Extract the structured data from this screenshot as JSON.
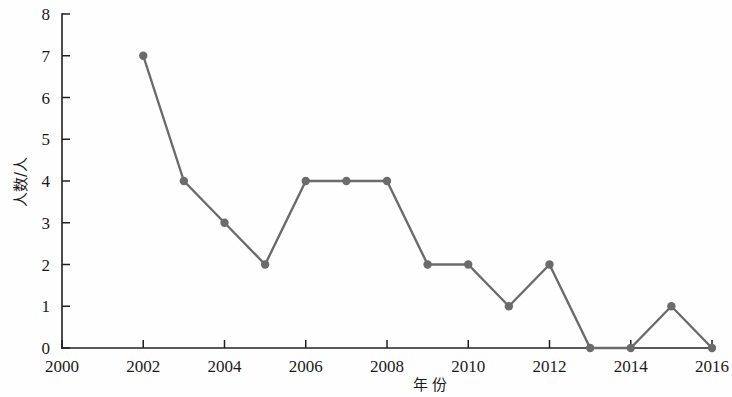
{
  "chart_data": {
    "type": "line",
    "title": "",
    "xlabel": "年 份",
    "ylabel": "人数/人",
    "x": [
      2002,
      2003,
      2004,
      2005,
      2006,
      2007,
      2008,
      2009,
      2010,
      2011,
      2012,
      2013,
      2014,
      2015,
      2016
    ],
    "values": [
      7,
      4,
      3,
      2,
      4,
      4,
      4,
      2,
      2,
      1,
      2,
      0,
      0,
      1,
      0
    ],
    "series": [
      {
        "name": "人数",
        "values": [
          7,
          4,
          3,
          2,
          4,
          4,
          4,
          2,
          2,
          1,
          2,
          0,
          0,
          1,
          0
        ]
      }
    ],
    "xlim": [
      2000,
      2016
    ],
    "ylim": [
      0,
      8
    ],
    "x_tick_labels": [
      "2000",
      "2002",
      "2004",
      "2006",
      "2008",
      "2010",
      "2012",
      "2014",
      "2016"
    ],
    "x_tick_values": [
      2000,
      2002,
      2004,
      2006,
      2008,
      2010,
      2012,
      2014,
      2016
    ],
    "x_minor_step": 1,
    "y_tick_labels": [
      "0",
      "1",
      "2",
      "3",
      "4",
      "5",
      "6",
      "7",
      "8"
    ],
    "y_tick_values": [
      0,
      1,
      2,
      3,
      4,
      5,
      6,
      7,
      8
    ],
    "grid": false,
    "legend": null,
    "legend_position": "none",
    "line_color": "#6b6b6b",
    "marker_color": "#6b6b6b",
    "axis_color": "#202020",
    "background_color": "#fefefe",
    "marker_shape": "circle",
    "annotations": []
  }
}
